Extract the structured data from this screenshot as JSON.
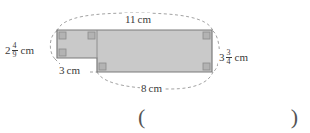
{
  "figure": {
    "type": "composite-rectilinear-L-shape",
    "fill_color": "#c9c9c9",
    "stroke_color": "#7a7a7a",
    "leader_color": "#8a8a8a",
    "text_color": "#3a3a3a"
  },
  "dimensions": {
    "top": {
      "name": "top-width",
      "whole": "11",
      "numerator": "",
      "denominator": "",
      "unit": "cm",
      "full_text": "11 cm"
    },
    "left": {
      "name": "left-height",
      "whole": "2",
      "numerator": "4",
      "denominator": "9",
      "unit": "cm",
      "full_text": "2 4/9 cm"
    },
    "right": {
      "name": "right-height",
      "whole": "3",
      "numerator": "3",
      "denominator": "4",
      "unit": "cm",
      "full_text": "3 3/4 cm"
    },
    "bottom": {
      "name": "bottom-width",
      "whole": "8",
      "numerator": "",
      "denominator": "",
      "unit": "cm",
      "full_text": "8 cm"
    },
    "inner": {
      "name": "inner-step-width",
      "whole": "3",
      "numerator": "",
      "denominator": "",
      "unit": "cm",
      "full_text": "3 cm"
    }
  },
  "answer": {
    "open_paren": "(",
    "close_paren": ")",
    "value": ""
  }
}
